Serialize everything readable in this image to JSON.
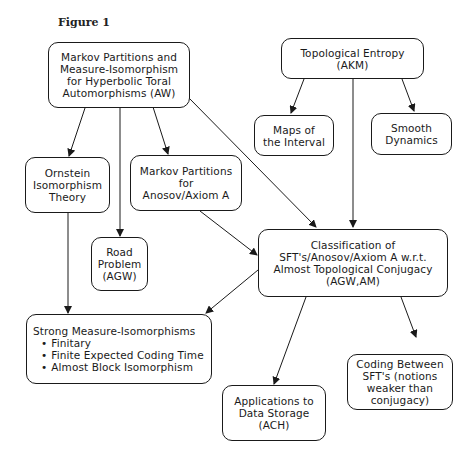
{
  "figure": {
    "label": "Figure 1"
  },
  "nodes": {
    "aw": {
      "lines": [
        "Markov Partitions and",
        "Measure-Isomorphism",
        "for Hyperbolic Toral",
        "Automorphisms (AW)"
      ]
    },
    "akm": {
      "lines": [
        "Topological Entropy",
        "(AKM)"
      ]
    },
    "maps": {
      "lines": [
        "Maps of",
        "the Interval"
      ]
    },
    "smooth": {
      "lines": [
        "Smooth",
        "Dynamics"
      ]
    },
    "ornstein": {
      "lines": [
        "Ornstein",
        "Isomorphism",
        "Theory"
      ]
    },
    "anosov": {
      "lines": [
        "Markov Partitions",
        "for",
        "Anosov/Axiom A"
      ]
    },
    "road": {
      "lines": [
        "Road",
        "Problem",
        "(AGW)"
      ]
    },
    "classification": {
      "lines": [
        "Classification of",
        "SFT's/Anosov/Axiom A w.r.t.",
        "Almost Topological Conjugacy",
        "(AGW,AM)"
      ]
    },
    "strong": {
      "title": "Strong Measure-Isomorphisms",
      "bullets": [
        "Finitary",
        "Finite Expected Coding Time",
        "Almost Block Isomorphism"
      ]
    },
    "coding": {
      "lines": [
        "Coding Between",
        "SFT's (notions",
        "weaker than",
        "conjugacy)"
      ]
    },
    "storage": {
      "lines": [
        "Applications to",
        "Data Storage",
        "(ACH)"
      ]
    }
  },
  "edges": [
    {
      "from": "aw",
      "to": "ornstein"
    },
    {
      "from": "aw",
      "to": "road"
    },
    {
      "from": "aw",
      "to": "anosov"
    },
    {
      "from": "aw",
      "to": "classification"
    },
    {
      "from": "akm",
      "to": "maps"
    },
    {
      "from": "akm",
      "to": "smooth"
    },
    {
      "from": "akm",
      "to": "classification"
    },
    {
      "from": "anosov",
      "to": "classification"
    },
    {
      "from": "ornstein",
      "to": "strong"
    },
    {
      "from": "classification",
      "to": "strong"
    },
    {
      "from": "classification",
      "to": "storage"
    },
    {
      "from": "classification",
      "to": "coding"
    }
  ]
}
